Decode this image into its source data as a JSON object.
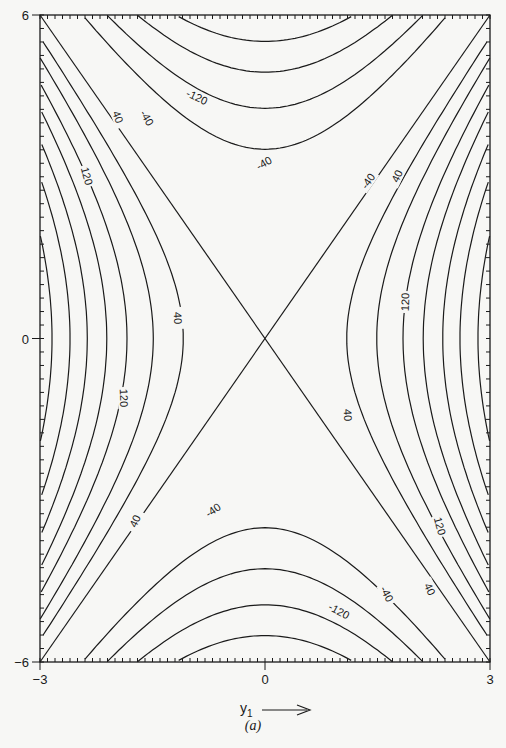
{
  "chart_data": {
    "type": "contour",
    "title": "",
    "caption": "(a)",
    "xlabel": "y1",
    "xlabel_arrow": "→",
    "ylabel": "",
    "xlim": [
      -3,
      3
    ],
    "ylim": [
      -6,
      6
    ],
    "x_ticks": [
      -3,
      0,
      3
    ],
    "y_ticks": [
      -6,
      0,
      6
    ],
    "x_tick_labels": [
      "-3",
      "0",
      "3"
    ],
    "y_tick_labels": [
      "-6",
      "0",
      "6"
    ],
    "grid": false,
    "zero_contour_slope": 2.0,
    "positive_levels": {
      "values": [
        40,
        80,
        120,
        160,
        200,
        240,
        280
      ],
      "y1_intercepts": [
        1.09,
        1.49,
        1.84,
        2.11,
        2.37,
        2.6,
        2.84
      ]
    },
    "negative_levels": {
      "values": [
        -40,
        -80,
        -120,
        -160,
        -200
      ],
      "y2_intercepts": [
        3.51,
        4.27,
        4.94,
        5.51,
        6.03
      ]
    },
    "contour_labels": [
      {
        "text": "40",
        "x": 118,
        "y": 117,
        "rot": 70
      },
      {
        "text": "-40",
        "x": 147,
        "y": 118,
        "rot": 60
      },
      {
        "text": "-120",
        "x": 197,
        "y": 97,
        "rot": 25
      },
      {
        "text": "120",
        "x": 87,
        "y": 176,
        "rot": 75
      },
      {
        "text": "40",
        "x": 178,
        "y": 318,
        "rot": 88
      },
      {
        "text": "120",
        "x": 124,
        "y": 398,
        "rot": 88
      },
      {
        "text": "-40",
        "x": 368,
        "y": 181,
        "rot": -55
      },
      {
        "text": "40",
        "x": 397,
        "y": 176,
        "rot": -65
      },
      {
        "text": "-40",
        "x": 264,
        "y": 163,
        "rot": -30
      },
      {
        "text": "120",
        "x": 405,
        "y": 302,
        "rot": -88
      },
      {
        "text": "40",
        "x": 348,
        "y": 415,
        "rot": 88
      },
      {
        "text": "40",
        "x": 135,
        "y": 521,
        "rot": -65
      },
      {
        "text": "-40",
        "x": 213,
        "y": 510,
        "rot": -35
      },
      {
        "text": "120",
        "x": 440,
        "y": 526,
        "rot": 75
      },
      {
        "text": "-40",
        "x": 387,
        "y": 594,
        "rot": 62
      },
      {
        "text": "40",
        "x": 430,
        "y": 589,
        "rot": 65
      },
      {
        "text": "-120",
        "x": 339,
        "y": 611,
        "rot": 28
      }
    ]
  }
}
